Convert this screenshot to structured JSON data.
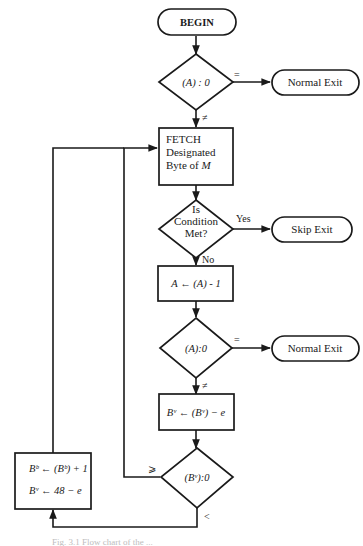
{
  "flowchart": {
    "begin": {
      "label": "BEGIN"
    },
    "decision_a_zero_1": {
      "label": "(A) : 0",
      "equal_label": "=",
      "not_equal_label": "≠"
    },
    "normal_exit_1": {
      "label": "Normal Exit"
    },
    "fetch": {
      "line1": "FETCH",
      "line2": "Designated",
      "line3_prefix": "Byte of ",
      "line3_var": "M"
    },
    "decision_condition": {
      "line1": "Is",
      "line2": "Condition",
      "line3": "Met?",
      "yes_label": "Yes",
      "no_label": "No"
    },
    "skip_exit": {
      "label": "Skip Exit"
    },
    "decrement_a": {
      "label": "A ← (A) - 1"
    },
    "decision_a_zero_2": {
      "label": "(A):0",
      "equal_label": "=",
      "not_equal_label": "≠"
    },
    "normal_exit_2": {
      "label": "Normal Exit"
    },
    "update_bv": {
      "label": "Bᵛ ← (Bᵛ) − e"
    },
    "decision_bv_zero": {
      "label": "(Bᵛ):0",
      "ge_label": "⩾",
      "lt_label": "<"
    },
    "update_bb": {
      "line1": "Bᵇ ← (Bᵇ) + 1",
      "line2": "Bᵛ ← 48 − e"
    }
  },
  "caption": {
    "text": "Fig. 3.1 Flow chart of the ..."
  }
}
